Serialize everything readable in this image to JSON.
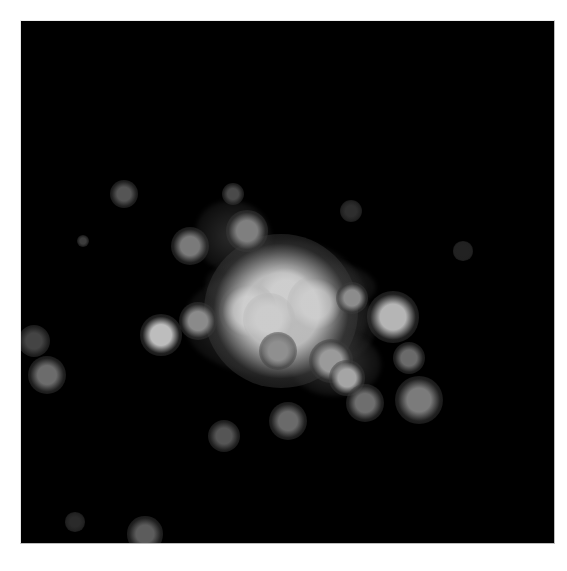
{
  "image": {
    "description": "Grayscale astronomical image of a galaxy cluster: bright central merging galaxies surrounded by diffuse intracluster light and scattered member galaxies",
    "background_color": "#000000",
    "page_background": "#ffffff",
    "frame": {
      "x": 20,
      "y": 20,
      "width": 533,
      "height": 522,
      "border_color": "#bdbdbd"
    }
  },
  "diffuse_light": [
    {
      "x": 218,
      "y": 240,
      "w": 150,
      "h": 130,
      "color": "rgba(70,70,70,0.85)"
    },
    {
      "x": 185,
      "y": 270,
      "w": 190,
      "h": 105,
      "color": "rgba(85,85,85,0.8)"
    },
    {
      "x": 290,
      "y": 330,
      "w": 90,
      "h": 65,
      "color": "rgba(65,65,65,0.85)"
    },
    {
      "x": 195,
      "y": 200,
      "w": 75,
      "h": 70,
      "color": "rgba(55,55,55,0.8)"
    },
    {
      "x": 205,
      "y": 255,
      "w": 170,
      "h": 60,
      "color": "rgba(100,100,100,0.7)"
    }
  ],
  "sources": [
    {
      "name": "bcg-core-center",
      "x": 285,
      "y": 295,
      "r": 20,
      "core": "#ffffff",
      "edge": "rgba(230,230,230,0)"
    },
    {
      "name": "bcg-core-left",
      "x": 247,
      "y": 310,
      "r": 18,
      "core": "#ffffff",
      "edge": "rgba(230,230,230,0)"
    },
    {
      "name": "bcg-core-right",
      "x": 315,
      "y": 303,
      "r": 18,
      "core": "#f8f8f8",
      "edge": "rgba(220,220,220,0)"
    },
    {
      "name": "bcg-core-lower",
      "x": 268,
      "y": 318,
      "r": 16,
      "core": "#efefef",
      "edge": "rgba(210,210,210,0)"
    },
    {
      "name": "bcg-envelope",
      "x": 280,
      "y": 310,
      "r": 48,
      "core": "rgba(200,200,200,0.9)",
      "edge": "rgba(120,120,120,0)"
    },
    {
      "name": "galaxy-sw-of-core",
      "x": 197,
      "y": 320,
      "r": 12,
      "core": "#8a8a8a",
      "edge": "rgba(80,80,80,0)"
    },
    {
      "name": "galaxy-e-of-core",
      "x": 351,
      "y": 297,
      "r": 10,
      "core": "#8c8c8c",
      "edge": "rgba(70,70,70,0)"
    },
    {
      "name": "galaxy-east-bright",
      "x": 392,
      "y": 316,
      "r": 16,
      "core": "#b5b5b5",
      "edge": "rgba(90,90,90,0)"
    },
    {
      "name": "galaxy-north",
      "x": 246,
      "y": 230,
      "r": 13,
      "core": "#7f7f7f",
      "edge": "rgba(80,80,80,0)"
    },
    {
      "name": "galaxy-nw",
      "x": 189,
      "y": 245,
      "r": 12,
      "core": "#7a7a7a",
      "edge": "rgba(70,70,70,0)"
    },
    {
      "name": "galaxy-south-1",
      "x": 277,
      "y": 350,
      "r": 12,
      "core": "#8f8f8f",
      "edge": "rgba(80,80,80,0)"
    },
    {
      "name": "galaxy-south-2",
      "x": 330,
      "y": 360,
      "r": 14,
      "core": "#9a9a9a",
      "edge": "rgba(80,80,80,0)"
    },
    {
      "name": "galaxy-south-3",
      "x": 346,
      "y": 377,
      "r": 11,
      "core": "#a5a5a5",
      "edge": "rgba(90,90,90,0)"
    },
    {
      "name": "galaxy-west-ring",
      "x": 160,
      "y": 334,
      "r": 13,
      "core": "#bdbdbd",
      "edge": "rgba(60,60,60,0)"
    },
    {
      "name": "galaxy-far-west",
      "x": 46,
      "y": 374,
      "r": 12,
      "core": "#6c6c6c",
      "edge": "rgba(50,50,50,0)"
    },
    {
      "name": "galaxy-edge-west",
      "x": 33,
      "y": 340,
      "r": 10,
      "core": "#444444",
      "edge": "rgba(40,40,40,0)"
    },
    {
      "name": "galaxy-ne-faint",
      "x": 123,
      "y": 193,
      "r": 9,
      "core": "#555555",
      "edge": "rgba(40,40,40,0)"
    },
    {
      "name": "galaxy-n-faint",
      "x": 232,
      "y": 193,
      "r": 7,
      "core": "#4a4a4a",
      "edge": "rgba(40,40,40,0)"
    },
    {
      "name": "galaxy-small-nw",
      "x": 82,
      "y": 240,
      "r": 4,
      "core": "#3c3c3c",
      "edge": "rgba(30,30,30,0)"
    },
    {
      "name": "galaxy-ne-faint-2",
      "x": 350,
      "y": 210,
      "r": 7,
      "core": "#2e2e2e",
      "edge": "rgba(30,30,30,0)"
    },
    {
      "name": "galaxy-east-faint",
      "x": 462,
      "y": 250,
      "r": 6,
      "core": "#222222",
      "edge": "rgba(20,20,20,0)"
    },
    {
      "name": "galaxy-se-1",
      "x": 408,
      "y": 357,
      "r": 10,
      "core": "#6a6a6a",
      "edge": "rgba(50,50,50,0)"
    },
    {
      "name": "galaxy-se-elongated",
      "x": 418,
      "y": 399,
      "r": 15,
      "core": "#7b7b7b",
      "edge": "rgba(50,50,50,0)"
    },
    {
      "name": "galaxy-se-2",
      "x": 364,
      "y": 402,
      "r": 12,
      "core": "#6e6e6e",
      "edge": "rgba(50,50,50,0)"
    },
    {
      "name": "galaxy-south-ring",
      "x": 287,
      "y": 420,
      "r": 12,
      "core": "#6a6a6a",
      "edge": "rgba(45,45,45,0)"
    },
    {
      "name": "galaxy-south-faint",
      "x": 223,
      "y": 435,
      "r": 10,
      "core": "#555555",
      "edge": "rgba(40,40,40,0)"
    },
    {
      "name": "galaxy-bottom-edge",
      "x": 144,
      "y": 533,
      "r": 11,
      "core": "#5c5c5c",
      "edge": "rgba(40,40,40,0)"
    },
    {
      "name": "galaxy-bottom-faint",
      "x": 74,
      "y": 521,
      "r": 6,
      "core": "#2a2a2a",
      "edge": "rgba(20,20,20,0)"
    }
  ]
}
